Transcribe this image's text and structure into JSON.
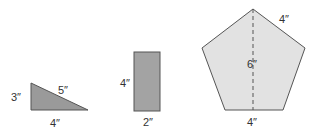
{
  "colors": {
    "triangle_fill": "#9a9a9a",
    "rectangle_fill": "#a3a3a3",
    "pentagon_fill": "#e2e2e2",
    "stroke": "#555555",
    "text": "#333333"
  },
  "shapes": {
    "triangle": {
      "type": "right-triangle",
      "labels": {
        "height": "3″",
        "hypotenuse": "5″",
        "base": "4″"
      }
    },
    "rectangle": {
      "type": "rectangle",
      "labels": {
        "height": "4″",
        "width": "2″"
      }
    },
    "pentagon": {
      "type": "regular-pentagon",
      "labels": {
        "side": "4″",
        "height": "6″",
        "base": "4″"
      }
    }
  }
}
